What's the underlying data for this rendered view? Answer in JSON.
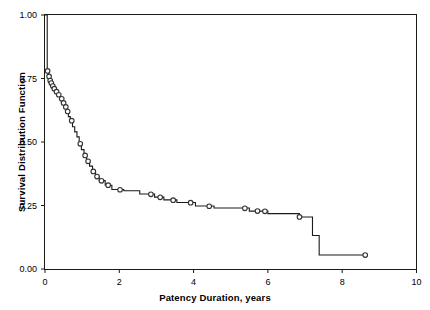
{
  "chart_data": {
    "type": "line",
    "subtype": "kaplan-meier-step",
    "title": "",
    "xlabel": "Patency Duration, years",
    "ylabel": "Survival Distribution Function",
    "xlim": [
      0,
      10
    ],
    "ylim": [
      0.0,
      1.0
    ],
    "xticks": [
      0,
      2,
      4,
      6,
      8,
      10
    ],
    "xticklabels": [
      "0",
      "2",
      "4",
      "6",
      "8",
      "10"
    ],
    "yticks": [
      0.0,
      0.25,
      0.5,
      0.75,
      1.0
    ],
    "yticklabels": [
      "0.00",
      "0.25",
      "0.50",
      "0.75",
      "1.00"
    ],
    "grid": false,
    "legend": null,
    "line_color": "#1a1a1a",
    "marker_shape": "circle-open",
    "marker_color": "#333333",
    "series": [
      {
        "name": "Survival Distribution Function",
        "step_points": [
          [
            0.0,
            1.0
          ],
          [
            0.06,
            1.0
          ],
          [
            0.06,
            0.78
          ],
          [
            0.09,
            0.78
          ],
          [
            0.09,
            0.76
          ],
          [
            0.12,
            0.76
          ],
          [
            0.12,
            0.745
          ],
          [
            0.15,
            0.745
          ],
          [
            0.15,
            0.735
          ],
          [
            0.19,
            0.735
          ],
          [
            0.19,
            0.722
          ],
          [
            0.23,
            0.722
          ],
          [
            0.23,
            0.712
          ],
          [
            0.27,
            0.712
          ],
          [
            0.27,
            0.7
          ],
          [
            0.33,
            0.7
          ],
          [
            0.33,
            0.688
          ],
          [
            0.4,
            0.688
          ],
          [
            0.4,
            0.672
          ],
          [
            0.47,
            0.672
          ],
          [
            0.47,
            0.655
          ],
          [
            0.52,
            0.655
          ],
          [
            0.52,
            0.64
          ],
          [
            0.58,
            0.64
          ],
          [
            0.58,
            0.622
          ],
          [
            0.63,
            0.622
          ],
          [
            0.63,
            0.6
          ],
          [
            0.68,
            0.6
          ],
          [
            0.68,
            0.585
          ],
          [
            0.74,
            0.585
          ],
          [
            0.74,
            0.56
          ],
          [
            0.8,
            0.56
          ],
          [
            0.8,
            0.54
          ],
          [
            0.86,
            0.54
          ],
          [
            0.86,
            0.52
          ],
          [
            0.92,
            0.52
          ],
          [
            0.92,
            0.495
          ],
          [
            0.98,
            0.495
          ],
          [
            0.98,
            0.47
          ],
          [
            1.05,
            0.47
          ],
          [
            1.05,
            0.448
          ],
          [
            1.12,
            0.448
          ],
          [
            1.12,
            0.425
          ],
          [
            1.2,
            0.425
          ],
          [
            1.2,
            0.405
          ],
          [
            1.28,
            0.405
          ],
          [
            1.28,
            0.385
          ],
          [
            1.36,
            0.385
          ],
          [
            1.36,
            0.365
          ],
          [
            1.46,
            0.365
          ],
          [
            1.46,
            0.348
          ],
          [
            1.62,
            0.348
          ],
          [
            1.62,
            0.33
          ],
          [
            1.8,
            0.33
          ],
          [
            1.8,
            0.313
          ],
          [
            2.12,
            0.313
          ],
          [
            2.12,
            0.308
          ],
          [
            2.55,
            0.308
          ],
          [
            2.55,
            0.295
          ],
          [
            2.95,
            0.295
          ],
          [
            2.95,
            0.283
          ],
          [
            3.2,
            0.283
          ],
          [
            3.2,
            0.272
          ],
          [
            3.55,
            0.272
          ],
          [
            3.55,
            0.262
          ],
          [
            4.05,
            0.262
          ],
          [
            4.05,
            0.248
          ],
          [
            4.55,
            0.248
          ],
          [
            4.55,
            0.24
          ],
          [
            5.5,
            0.24
          ],
          [
            5.5,
            0.228
          ],
          [
            6.0,
            0.228
          ],
          [
            6.0,
            0.218
          ],
          [
            6.85,
            0.218
          ],
          [
            6.85,
            0.205
          ],
          [
            7.2,
            0.205
          ],
          [
            7.2,
            0.132
          ],
          [
            7.38,
            0.132
          ],
          [
            7.38,
            0.055
          ],
          [
            8.62,
            0.055
          ]
        ],
        "censored_points": [
          [
            0.07,
            0.78
          ],
          [
            0.11,
            0.758
          ],
          [
            0.14,
            0.742
          ],
          [
            0.17,
            0.732
          ],
          [
            0.21,
            0.72
          ],
          [
            0.25,
            0.71
          ],
          [
            0.31,
            0.698
          ],
          [
            0.37,
            0.686
          ],
          [
            0.45,
            0.67
          ],
          [
            0.5,
            0.654
          ],
          [
            0.56,
            0.638
          ],
          [
            0.61,
            0.62
          ],
          [
            0.72,
            0.584
          ],
          [
            0.95,
            0.493
          ],
          [
            1.08,
            0.447
          ],
          [
            1.16,
            0.424
          ],
          [
            1.3,
            0.384
          ],
          [
            1.4,
            0.364
          ],
          [
            1.52,
            0.347
          ],
          [
            1.7,
            0.33
          ],
          [
            2.02,
            0.312
          ],
          [
            2.85,
            0.294
          ],
          [
            3.1,
            0.282
          ],
          [
            3.45,
            0.271
          ],
          [
            3.92,
            0.261
          ],
          [
            4.42,
            0.247
          ],
          [
            5.38,
            0.239
          ],
          [
            5.72,
            0.228
          ],
          [
            5.92,
            0.227
          ],
          [
            6.85,
            0.205
          ],
          [
            8.62,
            0.055
          ]
        ]
      }
    ]
  },
  "axes": {
    "x_title": "Patency Duration, years",
    "y_title": "Survival Distribution Function"
  }
}
